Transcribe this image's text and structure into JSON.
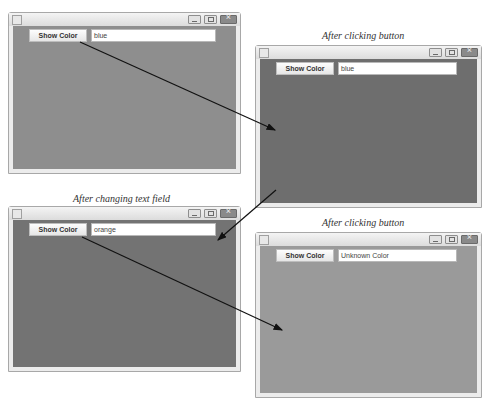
{
  "panels": [
    {
      "caption": "",
      "button_label": "Show Color",
      "field_value": "blue",
      "background": "#8e8e8e"
    },
    {
      "caption": "After clicking button",
      "button_label": "Show Color",
      "field_value": "blue",
      "background": "#6e6e6e"
    },
    {
      "caption": "After changing text field",
      "button_label": "Show Color",
      "field_value": "orange",
      "background": "#737373"
    },
    {
      "caption": "After clicking button",
      "button_label": "Show Color",
      "field_value": "Unknown Color",
      "background": "#9a9a9a"
    }
  ],
  "window_controls": [
    "minimize-icon",
    "maximize-icon",
    "close-icon"
  ]
}
